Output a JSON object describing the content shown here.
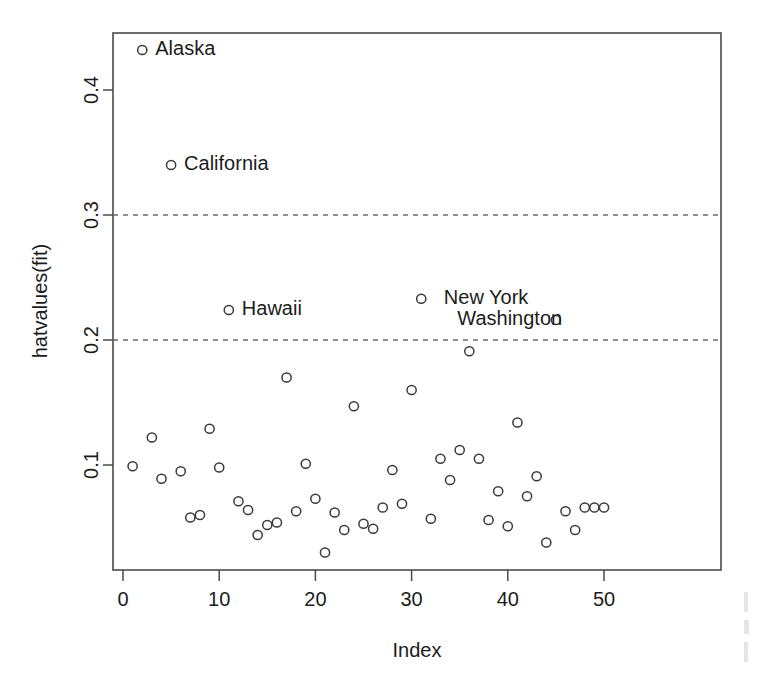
{
  "chart_data": {
    "type": "scatter",
    "title": "",
    "xlabel": "Index",
    "ylabel": "hatvalues(fit)",
    "xlim": [
      0,
      51
    ],
    "ylim": [
      0.018,
      0.452
    ],
    "xticks": [
      0,
      10,
      20,
      30,
      40,
      50
    ],
    "yticks": [
      0.1,
      0.2,
      0.3,
      0.4
    ],
    "xtick_labels": [
      "0",
      "10",
      "20",
      "30",
      "40",
      "50"
    ],
    "ytick_labels": [
      "0.1",
      "0.2",
      "0.3",
      "0.4"
    ],
    "grid": false,
    "legend": "none",
    "marker": "open-circle",
    "reference_lines": [
      {
        "name": "cutoff-2p-over-n",
        "orientation": "horizontal",
        "y": 0.2,
        "style": "dashed"
      },
      {
        "name": "cutoff-3p-over-n",
        "orientation": "horizontal",
        "y": 0.3,
        "style": "dashed"
      }
    ],
    "x": [
      1,
      2,
      3,
      4,
      5,
      6,
      7,
      8,
      9,
      10,
      11,
      12,
      13,
      14,
      15,
      16,
      17,
      18,
      19,
      20,
      21,
      22,
      23,
      24,
      25,
      26,
      27,
      28,
      29,
      30,
      31,
      32,
      33,
      34,
      35,
      36,
      37,
      38,
      39,
      40,
      41,
      42,
      43,
      44,
      45,
      46,
      47,
      48,
      49,
      50
    ],
    "values": [
      0.099,
      0.432,
      0.122,
      0.089,
      0.34,
      0.095,
      0.058,
      0.06,
      0.129,
      0.098,
      0.224,
      0.071,
      0.064,
      0.044,
      0.052,
      0.054,
      0.17,
      0.063,
      0.101,
      0.073,
      0.03,
      0.062,
      0.048,
      0.147,
      0.053,
      0.049,
      0.066,
      0.096,
      0.069,
      0.16,
      0.233,
      0.057,
      0.105,
      0.088,
      0.112,
      0.191,
      0.105,
      0.056,
      0.079,
      0.051,
      0.134,
      0.075,
      0.091,
      0.038,
      0.216,
      0.063,
      0.048,
      0.066,
      0.066,
      0.066
    ],
    "point_labels": [
      {
        "name": "Alaska",
        "x": 2,
        "y": 0.432,
        "label_side": "right"
      },
      {
        "name": "California",
        "x": 5,
        "y": 0.34,
        "label_side": "right"
      },
      {
        "name": "Hawaii",
        "x": 11,
        "y": 0.224,
        "label_side": "right"
      },
      {
        "name": "New York",
        "x": 32,
        "y": 0.233,
        "label_side": "right"
      },
      {
        "name": "Washington",
        "x": 47,
        "y": 0.216,
        "label_side": "left"
      }
    ]
  },
  "colors": {
    "background": "#ffffff",
    "axis": "#4a4a4a",
    "marker": "#3a3a3a",
    "text": "#1c1c1c",
    "cutoff": "#6b6b6b"
  }
}
